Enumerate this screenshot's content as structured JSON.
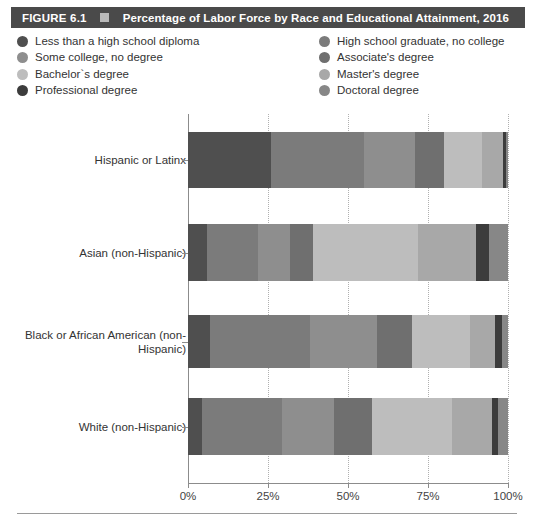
{
  "header": {
    "figure_number": "FIGURE 6.1",
    "marker_icon": "square-marker",
    "title": "Percentage of Labor Force by Race and Educational Attainment, 2016",
    "bg_color": "#4a4a4a",
    "text_color": "#ffffff"
  },
  "legend": {
    "left_column": [
      {
        "label": "Less than a high school diploma",
        "color": "#4f4f4f"
      },
      {
        "label": "Some college, no degree",
        "color": "#8e8e8e"
      },
      {
        "label": "Bachelor`s degree",
        "color": "#bdbdbd"
      },
      {
        "label": "Professional degree",
        "color": "#3c3c3c"
      }
    ],
    "right_column": [
      {
        "label": "High school graduate, no college",
        "color": "#7b7b7b"
      },
      {
        "label": "Associate's degree",
        "color": "#6f6f6f"
      },
      {
        "label": "Master's degree",
        "color": "#a8a8a8"
      },
      {
        "label": "Doctoral degree",
        "color": "#878787"
      }
    ]
  },
  "chart_data": {
    "type": "bar",
    "orientation": "horizontal",
    "stacked": true,
    "stacked_normalized": true,
    "title": "Percentage of Labor Force by Race and Educational Attainment, 2016",
    "xlabel": "",
    "ylabel": "",
    "xlim": [
      0,
      100
    ],
    "xticks": [
      0,
      25,
      50,
      75,
      100
    ],
    "xtick_labels": [
      "0%",
      "25%",
      "50%",
      "75%",
      "100%"
    ],
    "grid": "vertical-dotted",
    "legend_position": "top",
    "categories": [
      "Hispanic or Latinx",
      "Asian (non-Hispanic)",
      "Black or African American (non-Hispanic)",
      "White (non-Hispanic)"
    ],
    "series": [
      {
        "name": "Less than a high school diploma",
        "color": "#4f4f4f",
        "values": [
          26,
          6,
          7,
          4.5
        ]
      },
      {
        "name": "High school graduate, no college",
        "color": "#7b7b7b",
        "values": [
          29,
          16,
          31,
          25
        ]
      },
      {
        "name": "Some college, no degree",
        "color": "#8e8e8e",
        "values": [
          16,
          10,
          21,
          16
        ]
      },
      {
        "name": "Associate's degree",
        "color": "#6f6f6f",
        "values": [
          9,
          7,
          11,
          12
        ]
      },
      {
        "name": "Bachelor`s degree",
        "color": "#bdbdbd",
        "values": [
          12,
          33,
          18,
          25
        ]
      },
      {
        "name": "Master's degree",
        "color": "#a8a8a8",
        "values": [
          6.5,
          18,
          8,
          12.5
        ]
      },
      {
        "name": "Professional degree",
        "color": "#3c3c3c",
        "values": [
          1.0,
          4,
          2,
          2
        ]
      },
      {
        "name": "Doctoral degree",
        "color": "#878787",
        "values": [
          0.5,
          6,
          2,
          3
        ]
      }
    ]
  }
}
